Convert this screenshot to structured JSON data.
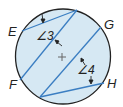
{
  "figure": {
    "type": "circle-chords-diagram",
    "colors": {
      "circle_fill": "#d6e8f3",
      "circle_stroke": "#222222",
      "chord_stroke": "#3b7ec2",
      "arrow": "#222222",
      "text": "#222222"
    },
    "points": {
      "E": "E",
      "F": "F",
      "G": "G",
      "H": "H"
    },
    "angles": {
      "angle3": "∠3",
      "angle4": "∠4"
    },
    "center_mark": "+"
  }
}
